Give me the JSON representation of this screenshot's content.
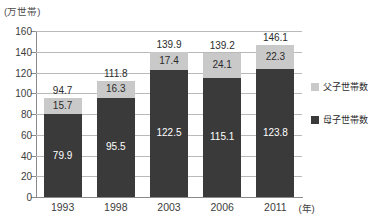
{
  "chart_data": {
    "type": "bar",
    "subtype": "stacked-bar",
    "title": "",
    "subtitle": "",
    "xlabel": "年",
    "ylabel": "",
    "unit_caption": "(万世帯)",
    "categories": [
      "1993",
      "1998",
      "2003",
      "2006",
      "2011"
    ],
    "ylim": [
      0,
      160
    ],
    "yticks": [
      160,
      140,
      120,
      100,
      80,
      60,
      40,
      20,
      0
    ],
    "ytick_labels": [
      "160",
      "140",
      "120",
      "100",
      "80",
      "60",
      "40",
      "20",
      "0"
    ],
    "grid": true,
    "legend_position": "right",
    "series": [
      {
        "name": "母子世帯数",
        "color": "#3a3a3a",
        "stack_position": "bottom",
        "values": [
          79.9,
          95.5,
          122.5,
          115.1,
          123.8
        ],
        "value_labels": [
          "79.9",
          "95.5",
          "122.5",
          "115.1",
          "123.8"
        ]
      },
      {
        "name": "父子世帯数",
        "color": "#c9c9c9",
        "stack_position": "top",
        "values": [
          15.7,
          16.3,
          17.4,
          24.1,
          22.3
        ],
        "value_labels": [
          "15.7",
          "16.3",
          "17.4",
          "24.1",
          "22.3"
        ]
      }
    ],
    "totals": [
      94.7,
      111.8,
      139.9,
      139.2,
      146.1
    ],
    "total_labels": [
      "94.7",
      "111.8",
      "139.9",
      "139.2",
      "146.1"
    ]
  },
  "legend": {
    "items": [
      {
        "label": "父子世帯数",
        "color": "#c9c9c9"
      },
      {
        "label": "母子世帯数",
        "color": "#3a3a3a"
      }
    ]
  },
  "axis": {
    "y_unit": "(万世帯)",
    "x_unit": "(年)"
  },
  "colors": {
    "series_bottom": "#3a3a3a",
    "series_top": "#c9c9c9",
    "gridline": "#b9b9b9",
    "axis": "#8a8a8a",
    "text": "#3d3d3d",
    "background": "#ffffff"
  }
}
